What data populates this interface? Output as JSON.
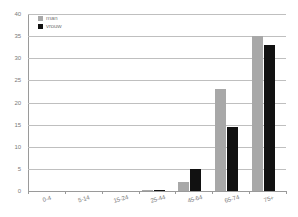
{
  "chart_data": {
    "type": "bar",
    "title": "",
    "subtitle": "",
    "xlabel": "",
    "ylabel": "",
    "ylim": [
      0,
      40
    ],
    "ytick_step": 5,
    "yticks": [
      "0",
      "5",
      "10",
      "15",
      "20",
      "25",
      "30",
      "35",
      "40"
    ],
    "grid": true,
    "grid_axis": "y",
    "legend_position": "top-left",
    "categories": [
      "0-4",
      "5-14",
      "15-24",
      "25-44",
      "45-64",
      "65-74",
      "75+"
    ],
    "series": [
      {
        "name": "man",
        "color": "#a8a8a8",
        "values": [
          0,
          0,
          0,
          0.1,
          2,
          23,
          35
        ]
      },
      {
        "name": "vrouw",
        "color": "#111111",
        "values": [
          0,
          0,
          0,
          0.2,
          5,
          14.5,
          33
        ]
      }
    ]
  },
  "colors": {
    "series_man": "#a8a8a8",
    "series_vrouw": "#111111",
    "gridline": "#bfbfbf",
    "axis": "#9a9a9a",
    "text": "#7a7a7a",
    "background": "#ffffff"
  }
}
